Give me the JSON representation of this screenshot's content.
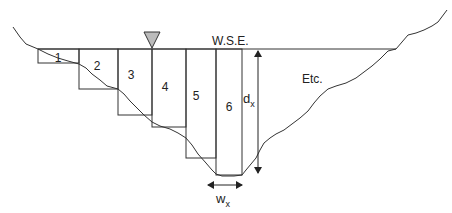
{
  "diagram": {
    "water_surface_label": "W.S.E.",
    "continuation_label": "Etc.",
    "depth_label": {
      "main": "d",
      "sub": "x"
    },
    "width_label": {
      "main": "w",
      "sub": "x"
    },
    "segments": [
      {
        "id": "1",
        "label": "1"
      },
      {
        "id": "2",
        "label": "2"
      },
      {
        "id": "3",
        "label": "3"
      },
      {
        "id": "4",
        "label": "4"
      },
      {
        "id": "5",
        "label": "5"
      },
      {
        "id": "6",
        "label": "6"
      }
    ],
    "colors": {
      "line": "#333333",
      "triangle_fill": "#bbbbbb",
      "background": "#ffffff"
    }
  }
}
